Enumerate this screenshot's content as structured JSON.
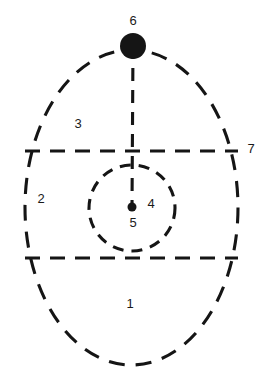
{
  "diagram": {
    "type": "labeled-region-diagram",
    "background_color": "#ffffff",
    "stroke_color": "#151515",
    "label_color": "#1a1a1a",
    "labels": [
      {
        "id": "label-1",
        "text": "1",
        "x": 130,
        "y": 305
      },
      {
        "id": "label-2",
        "text": "2",
        "x": 41,
        "y": 200
      },
      {
        "id": "label-3",
        "text": "3",
        "x": 78,
        "y": 125
      },
      {
        "id": "label-4",
        "text": "4",
        "x": 151,
        "y": 205
      },
      {
        "id": "label-5",
        "text": "5",
        "x": 133,
        "y": 224
      },
      {
        "id": "label-6",
        "text": "6",
        "x": 133,
        "y": 22
      },
      {
        "id": "label-7",
        "text": "7",
        "x": 251,
        "y": 150
      }
    ],
    "shapes": {
      "outer_ellipse": {
        "cx": 131.5,
        "cy": 207.5,
        "rx": 106.5,
        "ry": 157.5
      },
      "inner_circle": {
        "cx": 132,
        "cy": 208,
        "r": 43
      },
      "top_marker_dot": {
        "cx": 133,
        "cy": 46,
        "r": 13
      },
      "center_dot": {
        "cx": 132,
        "cy": 207,
        "r": 4.5
      },
      "vertical_line": {
        "x1": 133,
        "y1": 46,
        "x2": 132,
        "y2": 207
      },
      "upper_horizontal_line": {
        "x1": 25,
        "y1": 151,
        "x2": 238,
        "y2": 151
      },
      "lower_horizontal_line": {
        "x1": 25,
        "y1": 258,
        "x2": 238,
        "y2": 258
      }
    }
  }
}
